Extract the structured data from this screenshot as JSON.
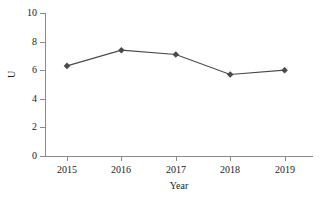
{
  "chart_data": {
    "type": "line",
    "title": "",
    "subtitle": "",
    "xlabel": "Year",
    "ylabel": "U",
    "categories": [
      "2015",
      "2016",
      "2017",
      "2018",
      "2019"
    ],
    "x": [
      2015,
      2016,
      2017,
      2018,
      2019
    ],
    "values": [
      6.3,
      7.4,
      7.1,
      5.7,
      6.0
    ],
    "series": [
      {
        "name": "U",
        "values": [
          6.3,
          7.4,
          7.1,
          5.7,
          6.0
        ]
      }
    ],
    "ylim": [
      0,
      10
    ],
    "y_ticks": [
      "0",
      "2",
      "4",
      "6",
      "8",
      "10"
    ],
    "y_tick_values": [
      0,
      2,
      4,
      6,
      8,
      10
    ],
    "x_ticks": [
      "2015",
      "2016",
      "2017",
      "2018",
      "2019"
    ],
    "grid": false,
    "legend": false,
    "legend_position": "none",
    "marker": "diamond",
    "colors": {
      "line": "#4a4a4a",
      "marker": "#4a4a4a",
      "axis": "#8a8a8a",
      "text": "#1a1a1a",
      "background": "#ffffff"
    }
  }
}
